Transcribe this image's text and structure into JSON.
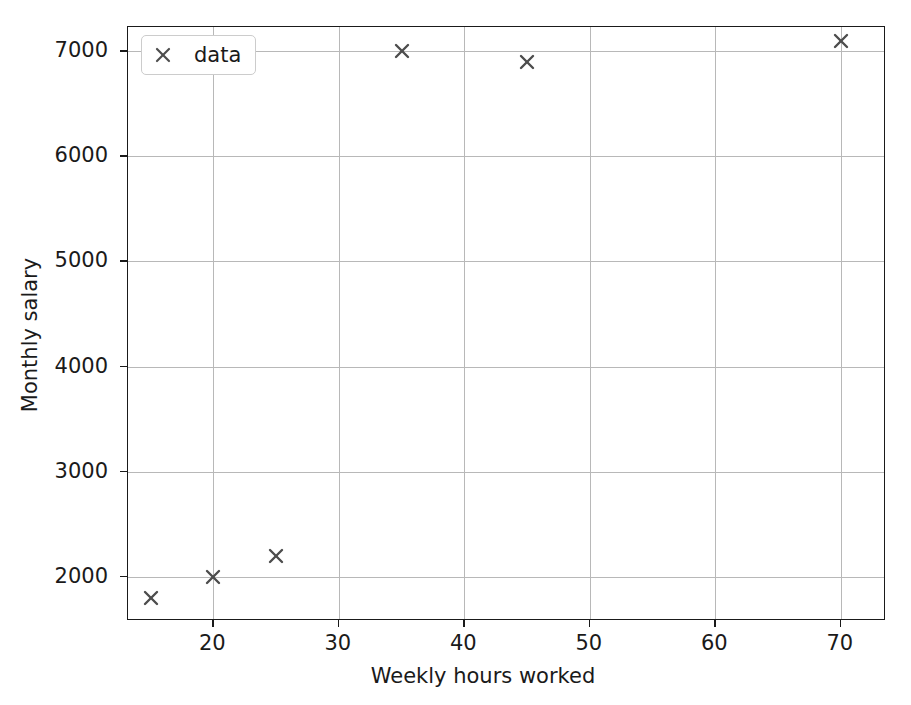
{
  "chart_data": {
    "type": "scatter",
    "title": "",
    "xlabel": "Weekly hours worked",
    "ylabel": "Monthly salary",
    "xlim": [
      13.2,
      73.6
    ],
    "ylim": [
      1580,
      7230
    ],
    "xticks": [
      20,
      30,
      40,
      50,
      60,
      70
    ],
    "xticklabels": [
      "20",
      "30",
      "40",
      "50",
      "60",
      "70"
    ],
    "yticks": [
      2000,
      3000,
      4000,
      5000,
      6000,
      7000
    ],
    "yticklabels": [
      "2000",
      "3000",
      "4000",
      "5000",
      "6000",
      "7000"
    ],
    "grid": true,
    "legend": {
      "position": "upper left",
      "entries": [
        {
          "label": "data",
          "marker": "x",
          "color": "#4d4d4d"
        }
      ]
    },
    "series": [
      {
        "name": "data",
        "marker": "x",
        "color": "#4d4d4d",
        "x": [
          15,
          20,
          25,
          35,
          45,
          70
        ],
        "y": [
          1800,
          2000,
          2200,
          7000,
          6900,
          7100
        ]
      }
    ]
  },
  "icons": {
    "marker_x": "x-marker-icon"
  }
}
